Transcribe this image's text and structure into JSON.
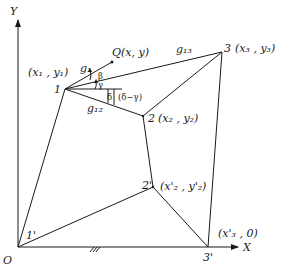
{
  "diagram": {
    "axes": {
      "x_label": "X",
      "y_label": "Y",
      "origin_label": "O"
    },
    "points": {
      "p1": {
        "id": "1",
        "coord": "(x₁ , y₁)"
      },
      "p2": {
        "id": "2",
        "coord": "(x₂ , y₂)"
      },
      "p3": {
        "id": "3",
        "coord": "(x₃ , y₃)"
      },
      "q": {
        "coord": "Q(x, y)"
      },
      "p1p": {
        "id": "1'"
      },
      "p2p": {
        "id": "2'",
        "coord": "(x'₂ , y'₂)"
      },
      "p3p": {
        "id": "3'",
        "coord": "(x'₃ , 0)"
      }
    },
    "edges": {
      "g1": "g₁",
      "g12": "g₁₂",
      "g13": "g₁₃"
    },
    "angles": {
      "beta": "β",
      "gamma": "γ",
      "delta": "δ",
      "delta_minus_gamma": "(δ−γ)"
    },
    "ground_hatch": "///"
  }
}
